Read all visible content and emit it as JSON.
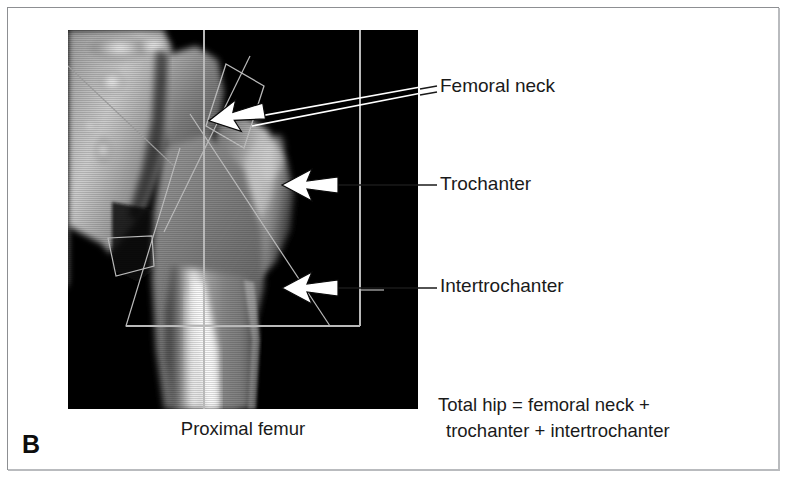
{
  "figure": {
    "panel_letter": "B",
    "scan_caption": "Proximal femur",
    "modality_description": "DXA scan of proximal femur with region-of-interest overlay"
  },
  "annotations": [
    {
      "id": "femoral-neck",
      "label": "Femoral neck",
      "arrow": "white-outline-arrow-left"
    },
    {
      "id": "trochanter",
      "label": "Trochanter",
      "arrow": "white-outline-arrow-left"
    },
    {
      "id": "intertrochanter",
      "label": "Intertrochanter",
      "arrow": "white-outline-arrow-left"
    }
  ],
  "formula": {
    "line1": "Total hip = femoral neck +",
    "line2": "trochanter + intertrochanter"
  },
  "colors": {
    "background": "#ffffff",
    "frame_border": "#8d8f92",
    "text": "#1a1a1a",
    "scan_background": "#000000",
    "roi_line": "#b9b9b9",
    "arrow_fill": "#ffffff",
    "arrow_stroke": "#000000"
  }
}
